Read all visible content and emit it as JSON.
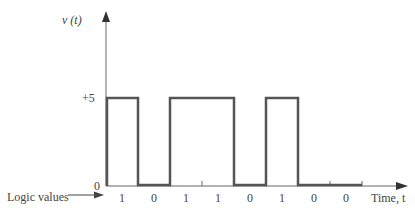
{
  "y_axis": {
    "label": "v (t)",
    "ticks": [
      "+5",
      "0"
    ]
  },
  "x_axis": {
    "label": "Time, t"
  },
  "logic_label": "Logic values",
  "bits": [
    "1",
    "0",
    "1",
    "1",
    "0",
    "1",
    "0",
    "0"
  ],
  "colors": {
    "signal": "#555555",
    "axis": "#666666"
  }
}
